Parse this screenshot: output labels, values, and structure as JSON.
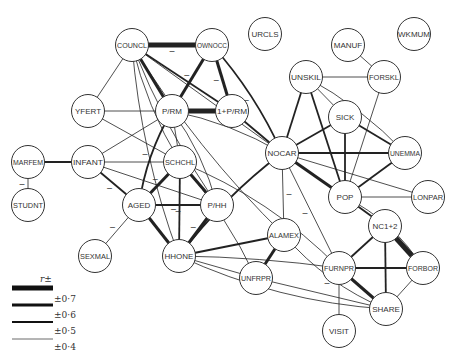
{
  "diagram": {
    "nodes": [
      {
        "id": "COUNCL",
        "label": "COUNCL",
        "x": 132,
        "y": 45
      },
      {
        "id": "OWNOCC",
        "label": "OWNOCC",
        "x": 212,
        "y": 45
      },
      {
        "id": "URCLS",
        "label": "URCLS",
        "x": 265,
        "y": 34
      },
      {
        "id": "MANUF",
        "label": "MANUF",
        "x": 348,
        "y": 45
      },
      {
        "id": "WKMUM",
        "label": "WKMUM",
        "x": 414,
        "y": 34
      },
      {
        "id": "YFERT",
        "label": "YFERT",
        "x": 88,
        "y": 111
      },
      {
        "id": "P/RM",
        "label": "P/RM",
        "x": 172,
        "y": 111
      },
      {
        "id": "1+P/RM",
        "label": "1+P/RM",
        "x": 232,
        "y": 111
      },
      {
        "id": "UNSKIL",
        "label": "UNSKIL",
        "x": 306,
        "y": 77
      },
      {
        "id": "FORSKL",
        "label": "FORSKL",
        "x": 384,
        "y": 77
      },
      {
        "id": "SICK",
        "label": "SICK",
        "x": 345,
        "y": 117
      },
      {
        "id": "NOCAR",
        "label": "NOCAR",
        "x": 282,
        "y": 153
      },
      {
        "id": "UNEMMA",
        "label": "UNEMMA",
        "x": 405,
        "y": 153
      },
      {
        "id": "MARFEM",
        "label": "MARFEM",
        "x": 28,
        "y": 162
      },
      {
        "id": "INFANT",
        "label": "INFANT",
        "x": 88,
        "y": 162
      },
      {
        "id": "SCHCHL",
        "label": "SCHCHL",
        "x": 180,
        "y": 162
      },
      {
        "id": "POP",
        "label": "POP",
        "x": 345,
        "y": 197
      },
      {
        "id": "LONPAR",
        "label": "LONPAR",
        "x": 428,
        "y": 197
      },
      {
        "id": "STUDNT",
        "label": "STUDNT",
        "x": 28,
        "y": 205
      },
      {
        "id": "AGED",
        "label": "AGED",
        "x": 139,
        "y": 205
      },
      {
        "id": "P/HH",
        "label": "P/HH",
        "x": 217,
        "y": 205
      },
      {
        "id": "NC1+2",
        "label": "NC1+2",
        "x": 385,
        "y": 226
      },
      {
        "id": "ALAMEX",
        "label": "ALAMEX",
        "x": 284,
        "y": 235
      },
      {
        "id": "SEXMAL",
        "label": "SEXMAL",
        "x": 95,
        "y": 256
      },
      {
        "id": "HHONE",
        "label": "HHONE",
        "x": 179,
        "y": 256
      },
      {
        "id": "FURNPR",
        "label": "FURNPR",
        "x": 339,
        "y": 268
      },
      {
        "id": "FORBOR",
        "label": "FORBOR",
        "x": 423,
        "y": 268
      },
      {
        "id": "UNFRPR",
        "label": "UNFRPR",
        "x": 256,
        "y": 278
      },
      {
        "id": "SHARE",
        "label": "SHARE",
        "x": 386,
        "y": 309
      },
      {
        "id": "VISIT",
        "label": "VISIT",
        "x": 339,
        "y": 331
      }
    ],
    "edges": [
      {
        "from": "COUNCL",
        "to": "OWNOCC",
        "r": 0.7,
        "negative": true,
        "curve": 0
      },
      {
        "from": "COUNCL",
        "to": "P/RM",
        "r": 0.6,
        "negative": false,
        "curve": 0
      },
      {
        "from": "COUNCL",
        "to": "1+P/RM",
        "r": 0.5,
        "negative": false,
        "curve": 0
      },
      {
        "from": "COUNCL",
        "to": "YFERT",
        "r": 0.4,
        "negative": false,
        "curve": 0
      },
      {
        "from": "COUNCL",
        "to": "NOCAR",
        "r": 0.4,
        "negative": false,
        "curve": 0
      },
      {
        "from": "COUNCL",
        "to": "SCHCHL",
        "r": 0.4,
        "negative": false,
        "curve": 10
      },
      {
        "from": "COUNCL",
        "to": "HHONE",
        "r": 0.4,
        "negative": false,
        "curve": 15
      },
      {
        "from": "COUNCL",
        "to": "P/HH",
        "r": 0.4,
        "negative": false,
        "curve": 10
      },
      {
        "from": "COUNCL",
        "to": "ALAMEX",
        "r": 0.4,
        "negative": false,
        "curve": 15
      },
      {
        "from": "OWNOCC",
        "to": "P/RM",
        "r": 0.6,
        "negative": true,
        "curve": 0
      },
      {
        "from": "OWNOCC",
        "to": "1+P/RM",
        "r": 0.6,
        "negative": true,
        "curve": 0
      },
      {
        "from": "OWNOCC",
        "to": "NOCAR",
        "r": 0.5,
        "negative": true,
        "curve": -10
      },
      {
        "from": "P/RM",
        "to": "1+P/RM",
        "r": 0.7,
        "negative": false,
        "curve": 0
      },
      {
        "from": "P/RM",
        "to": "YFERT",
        "r": 0.4,
        "negative": false,
        "curve": 0
      },
      {
        "from": "P/RM",
        "to": "SCHCHL",
        "r": 0.4,
        "negative": false,
        "curve": 0
      },
      {
        "from": "P/RM",
        "to": "AGED",
        "r": 0.5,
        "negative": true,
        "curve": 10
      },
      {
        "from": "P/RM",
        "to": "INFANT",
        "r": 0.4,
        "negative": false,
        "curve": 0
      },
      {
        "from": "P/RM",
        "to": "P/HH",
        "r": 0.4,
        "negative": false,
        "curve": -10
      },
      {
        "from": "P/RM",
        "to": "NOCAR",
        "r": 0.4,
        "negative": false,
        "curve": -10
      },
      {
        "from": "1+P/RM",
        "to": "NOCAR",
        "r": 0.5,
        "negative": false,
        "curve": 0
      },
      {
        "from": "YFERT",
        "to": "SCHCHL",
        "r": 0.4,
        "negative": false,
        "curve": 0
      },
      {
        "from": "MARFEM",
        "to": "INFANT",
        "r": 0.5,
        "negative": false,
        "curve": 0
      },
      {
        "from": "MARFEM",
        "to": "STUDNT",
        "r": 0.4,
        "negative": true,
        "curve": 0
      },
      {
        "from": "INFANT",
        "to": "SCHCHL",
        "r": 0.4,
        "negative": false,
        "curve": 0
      },
      {
        "from": "INFANT",
        "to": "AGED",
        "r": 0.5,
        "negative": true,
        "curve": 0
      },
      {
        "from": "INFANT",
        "to": "P/HH",
        "r": 0.4,
        "negative": false,
        "curve": 0
      },
      {
        "from": "SCHCHL",
        "to": "AGED",
        "r": 0.6,
        "negative": true,
        "curve": 0
      },
      {
        "from": "SCHCHL",
        "to": "P/HH",
        "r": 0.6,
        "negative": false,
        "curve": 0
      },
      {
        "from": "SCHCHL",
        "to": "HHONE",
        "r": 0.5,
        "negative": true,
        "curve": 0
      },
      {
        "from": "SCHCHL",
        "to": "UNFRPR",
        "r": 0.4,
        "negative": false,
        "curve": -10
      },
      {
        "from": "SCHCHL",
        "to": "FURNPR",
        "r": 0.4,
        "negative": false,
        "curve": -20
      },
      {
        "from": "AGED",
        "to": "P/HH",
        "r": 0.5,
        "negative": true,
        "curve": 0
      },
      {
        "from": "AGED",
        "to": "HHONE",
        "r": 0.6,
        "negative": false,
        "curve": 0
      },
      {
        "from": "AGED",
        "to": "SEXMAL",
        "r": 0.4,
        "negative": true,
        "curve": 0
      },
      {
        "from": "P/HH",
        "to": "HHONE",
        "r": 0.6,
        "negative": true,
        "curve": 0
      },
      {
        "from": "HHONE",
        "to": "NOCAR",
        "r": 0.5,
        "negative": false,
        "curve": -10
      },
      {
        "from": "HHONE",
        "to": "ALAMEX",
        "r": 0.5,
        "negative": false,
        "curve": 0
      },
      {
        "from": "HHONE",
        "to": "UNFRPR",
        "r": 0.4,
        "negative": false,
        "curve": 0
      },
      {
        "from": "HHONE",
        "to": "FURNPR",
        "r": 0.4,
        "negative": false,
        "curve": -5
      },
      {
        "from": "HHONE",
        "to": "SHARE",
        "r": 0.4,
        "negative": false,
        "curve": 20
      },
      {
        "from": "ALAMEX",
        "to": "UNFRPR",
        "r": 0.6,
        "negative": false,
        "curve": 0
      },
      {
        "from": "ALAMEX",
        "to": "NOCAR",
        "r": 0.4,
        "negative": true,
        "curve": 0
      },
      {
        "from": "ALAMEX",
        "to": "SHARE",
        "r": 0.4,
        "negative": true,
        "curve": 15
      },
      {
        "from": "NOCAR",
        "to": "UNSKIL",
        "r": 0.5,
        "negative": false,
        "curve": 0
      },
      {
        "from": "NOCAR",
        "to": "SICK",
        "r": 0.5,
        "negative": false,
        "curve": 0
      },
      {
        "from": "NOCAR",
        "to": "UNEMMA",
        "r": 0.5,
        "negative": false,
        "curve": 0
      },
      {
        "from": "NOCAR",
        "to": "POP",
        "r": 0.6,
        "negative": false,
        "curve": 0
      },
      {
        "from": "NOCAR",
        "to": "LONPAR",
        "r": 0.4,
        "negative": false,
        "curve": 0
      },
      {
        "from": "NOCAR",
        "to": "FURNPR",
        "r": 0.4,
        "negative": true,
        "curve": 0
      },
      {
        "from": "UNSKIL",
        "to": "FORSKL",
        "r": 0.4,
        "negative": false,
        "curve": 0
      },
      {
        "from": "UNSKIL",
        "to": "SICK",
        "r": 0.4,
        "negative": false,
        "curve": 0
      },
      {
        "from": "UNSKIL",
        "to": "POP",
        "r": 0.5,
        "negative": false,
        "curve": 0
      },
      {
        "from": "UNSKIL",
        "to": "UNEMMA",
        "r": 0.4,
        "negative": false,
        "curve": -10
      },
      {
        "from": "MANUF",
        "to": "FORSKL",
        "r": 0.4,
        "negative": false,
        "curve": 0
      },
      {
        "from": "FORSKL",
        "to": "POP",
        "r": 0.4,
        "negative": false,
        "curve": 0
      },
      {
        "from": "SICK",
        "to": "POP",
        "r": 0.5,
        "negative": false,
        "curve": 0
      },
      {
        "from": "SICK",
        "to": "UNEMMA",
        "r": 0.5,
        "negative": false,
        "curve": 0
      },
      {
        "from": "UNEMMA",
        "to": "POP",
        "r": 0.5,
        "negative": false,
        "curve": 0
      },
      {
        "from": "POP",
        "to": "LONPAR",
        "r": 0.4,
        "negative": false,
        "curve": 0
      },
      {
        "from": "POP",
        "to": "NC1+2",
        "r": 0.5,
        "negative": false,
        "curve": 0
      },
      {
        "from": "POP",
        "to": "FORBOR",
        "r": 0.4,
        "negative": false,
        "curve": -15
      },
      {
        "from": "NC1+2",
        "to": "FORBOR",
        "r": 0.7,
        "negative": false,
        "curve": 0
      },
      {
        "from": "NC1+2",
        "to": "FURNPR",
        "r": 0.5,
        "negative": false,
        "curve": 0
      },
      {
        "from": "NC1+2",
        "to": "SHARE",
        "r": 0.5,
        "negative": false,
        "curve": 0
      },
      {
        "from": "FURNPR",
        "to": "FORBOR",
        "r": 0.5,
        "negative": false,
        "curve": 0
      },
      {
        "from": "FURNPR",
        "to": "SHARE",
        "r": 0.6,
        "negative": false,
        "curve": 0
      },
      {
        "from": "FURNPR",
        "to": "VISIT",
        "r": 0.4,
        "negative": false,
        "curve": 0
      },
      {
        "from": "FORBOR",
        "to": "SHARE",
        "r": 0.4,
        "negative": false,
        "curve": 0
      },
      {
        "from": "UNFRPR",
        "to": "SHARE",
        "r": 0.4,
        "negative": false,
        "curve": 0
      }
    ],
    "legend": {
      "title": "r±",
      "items": [
        {
          "label": "±0·7",
          "width": 5
        },
        {
          "label": "±0·6",
          "width": 3
        },
        {
          "label": "±0·5",
          "width": 1.8
        },
        {
          "label": "±0·4",
          "width": 0.8
        }
      ]
    },
    "negative_marker": "–"
  }
}
